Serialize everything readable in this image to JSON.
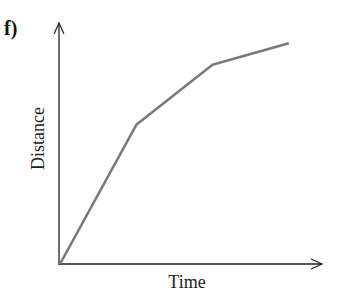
{
  "panel_label": "f)",
  "chart_data": {
    "type": "line",
    "title": "",
    "xlabel": "Time",
    "ylabel": "Distance",
    "grid": false,
    "ticks": "none",
    "series": [
      {
        "name": "distance-time",
        "points": [
          [
            0,
            0
          ],
          [
            0.29,
            0.58
          ],
          [
            0.58,
            0.83
          ],
          [
            0.87,
            0.92
          ]
        ]
      }
    ],
    "colors": {
      "line": "#7a7a7a",
      "axes": "#222222"
    }
  }
}
